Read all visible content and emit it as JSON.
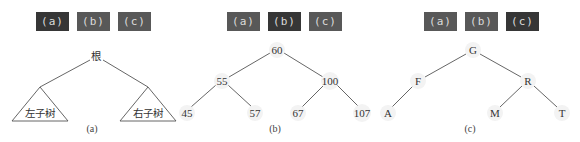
{
  "panels": [
    {
      "id": "a",
      "buttons": [
        {
          "label": "(a)",
          "active": true
        },
        {
          "label": "(b)",
          "active": false
        },
        {
          "label": "(c)",
          "active": false
        }
      ],
      "root": "根",
      "left_subtree": "左子树",
      "right_subtree": "右子树",
      "caption": "(a)"
    },
    {
      "id": "b",
      "buttons": [
        {
          "label": "(a)",
          "active": false
        },
        {
          "label": "(b)",
          "active": true
        },
        {
          "label": "(c)",
          "active": false
        }
      ],
      "nodes": {
        "root": "60",
        "l": "55",
        "r": "100",
        "ll": "45",
        "lr": "57",
        "rl": "67",
        "rr": "107"
      },
      "caption": "(b)"
    },
    {
      "id": "c",
      "buttons": [
        {
          "label": "(a)",
          "active": false
        },
        {
          "label": "(b)",
          "active": false
        },
        {
          "label": "(c)",
          "active": true
        }
      ],
      "nodes": {
        "root": "G",
        "l": "F",
        "r": "R",
        "ll": "A",
        "rl": "M",
        "rr": "T"
      },
      "caption": "(c)"
    }
  ],
  "colors": {
    "button_active": "#363636",
    "button_inactive": "#585858",
    "button_text": "#dcdcdc",
    "edge": "#555555"
  }
}
